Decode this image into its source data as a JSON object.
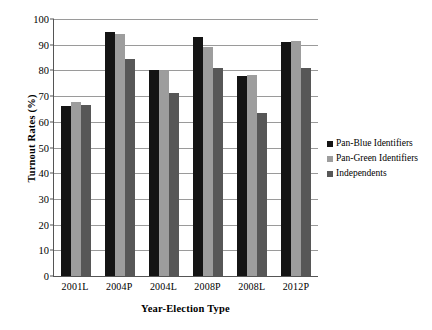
{
  "chart_data": {
    "type": "bar",
    "title": "",
    "xlabel": "Year-Election Type",
    "ylabel": "Turnout Rates (%)",
    "categories": [
      "2001L",
      "2004P",
      "2004L",
      "2008P",
      "2008L",
      "2012P"
    ],
    "series": [
      {
        "name": "Pan-Blue Identifiers",
        "color": "#141414",
        "values": [
          66.2,
          95.0,
          80.3,
          93.0,
          78.0,
          91.2
        ]
      },
      {
        "name": "Pan-Green Identifiers",
        "color": "#9d9d9d",
        "values": [
          67.6,
          94.0,
          79.7,
          89.0,
          78.3,
          91.4
        ]
      },
      {
        "name": "Independents",
        "color": "#575757",
        "values": [
          66.5,
          84.5,
          71.4,
          80.8,
          63.5,
          80.8
        ]
      }
    ],
    "ylim": [
      0,
      100
    ],
    "y_ticks": [
      0,
      10,
      20,
      30,
      40,
      50,
      60,
      70,
      80,
      90,
      100
    ],
    "grid": true,
    "legend_position": "right"
  }
}
